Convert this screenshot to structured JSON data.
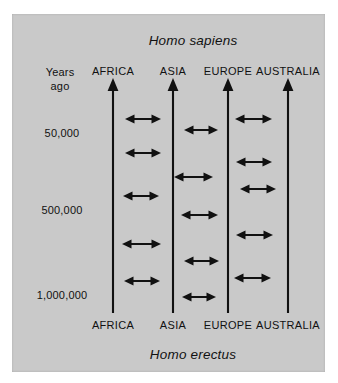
{
  "figure": {
    "background_color": "#ffffff",
    "panel_color": "#c9c9c9",
    "ink_color": "#111111"
  },
  "titles": {
    "top_species": "Homo sapiens",
    "bottom_species": "Homo erectus"
  },
  "axis": {
    "header_line1": "Years",
    "header_line2": "ago",
    "ticks": [
      {
        "label": "50,000",
        "y": 133
      },
      {
        "label": "500,000",
        "y": 210
      },
      {
        "label": "1,000,000",
        "y": 295
      }
    ]
  },
  "columns": [
    {
      "id": "africa",
      "label": "AFRICA",
      "x": 113
    },
    {
      "id": "asia",
      "label": "ASIA",
      "x": 173
    },
    {
      "id": "europe",
      "label": "EUROPE",
      "x": 228
    },
    {
      "id": "australia",
      "label": "AUSTRALIA",
      "x": 288
    }
  ],
  "chart_data": {
    "type": "diagram",
    "subtitle": "Homo erectus populations evolving into Homo sapiens with gene flow between regions",
    "top_label": "Homo sapiens",
    "bottom_label": "Homo erectus",
    "ylabel": "Years ago",
    "y_direction": "time increases downward (present at top)",
    "y_ticks": [
      "50,000",
      "500,000",
      "1,000,000"
    ],
    "regions": [
      "AFRICA",
      "ASIA",
      "EUROPE",
      "AUSTRALIA"
    ],
    "lineage_arrows": [
      {
        "region": "AFRICA",
        "x": 113,
        "y_top": 78,
        "y_bottom": 313,
        "direction": "up"
      },
      {
        "region": "ASIA",
        "x": 173,
        "y_top": 78,
        "y_bottom": 313,
        "direction": "up"
      },
      {
        "region": "EUROPE",
        "x": 228,
        "y_top": 78,
        "y_bottom": 313,
        "direction": "up"
      },
      {
        "region": "AUSTRALIA",
        "x": 288,
        "y_top": 78,
        "y_bottom": 313,
        "direction": "up"
      }
    ],
    "gene_flow_arrows": [
      {
        "from": "AFRICA",
        "to": "ASIA",
        "x1": 125,
        "x2": 161,
        "y": 119
      },
      {
        "from": "AFRICA",
        "to": "ASIA",
        "x1": 125,
        "x2": 161,
        "y": 153
      },
      {
        "from": "AFRICA",
        "to": "ASIA",
        "x1": 123,
        "x2": 159,
        "y": 196
      },
      {
        "from": "AFRICA",
        "to": "ASIA",
        "x1": 122,
        "x2": 161,
        "y": 244
      },
      {
        "from": "AFRICA",
        "to": "ASIA",
        "x1": 124,
        "x2": 160,
        "y": 281
      },
      {
        "from": "ASIA",
        "to": "EUROPE",
        "x1": 184,
        "x2": 218,
        "y": 130
      },
      {
        "from": "ASIA",
        "to": "EUROPE",
        "x1": 174,
        "x2": 213,
        "y": 177
      },
      {
        "from": "ASIA",
        "to": "EUROPE",
        "x1": 181,
        "x2": 218,
        "y": 215
      },
      {
        "from": "ASIA",
        "to": "EUROPE",
        "x1": 184,
        "x2": 219,
        "y": 261
      },
      {
        "from": "ASIA",
        "to": "EUROPE",
        "x1": 182,
        "x2": 216,
        "y": 297
      },
      {
        "from": "EUROPE",
        "to": "AUSTRALIA",
        "x1": 235,
        "x2": 272,
        "y": 119
      },
      {
        "from": "EUROPE",
        "to": "AUSTRALIA",
        "x1": 236,
        "x2": 272,
        "y": 162
      },
      {
        "from": "EUROPE",
        "to": "AUSTRALIA",
        "x1": 240,
        "x2": 276,
        "y": 189
      },
      {
        "from": "EUROPE",
        "to": "AUSTRALIA",
        "x1": 236,
        "x2": 273,
        "y": 235
      },
      {
        "from": "EUROPE",
        "to": "AUSTRALIA",
        "x1": 234,
        "x2": 271,
        "y": 278
      }
    ]
  }
}
